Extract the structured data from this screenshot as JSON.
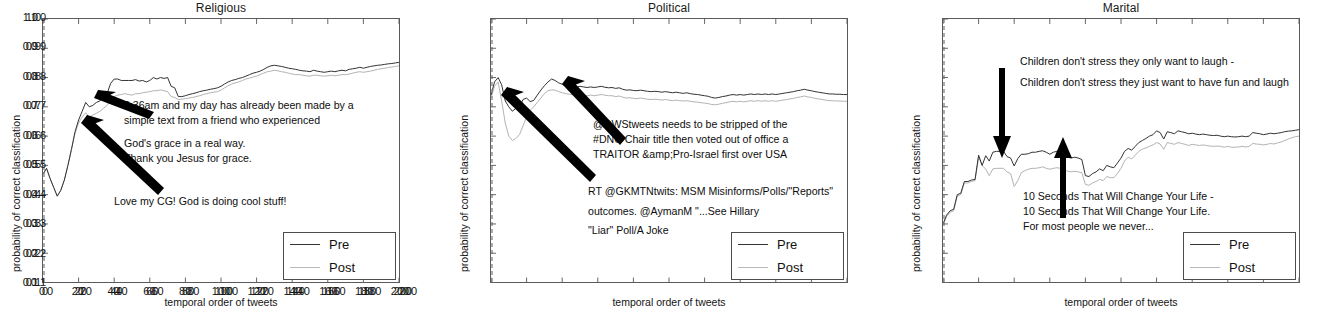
{
  "figure": {
    "width": 1336,
    "height": 311,
    "background": "#ffffff",
    "pre_color": "#333333",
    "post_color": "#b3b3b3",
    "axis_color": "#5a5a5a",
    "text_color": "#101010"
  },
  "axes": {
    "xlabel": "temporal order of tweets",
    "ylabel": "probability of correct classification",
    "xticks": [
      "0",
      "20",
      "40",
      "60",
      "80",
      "100",
      "120",
      "140",
      "160",
      "180",
      "200"
    ],
    "yticks": [
      "1.0",
      "0.9",
      "0.8",
      "0.7",
      "0.6",
      "0.5",
      "0.4",
      "0.3",
      "0.2",
      "0.1"
    ],
    "xlim": [
      0,
      200
    ],
    "ylim": [
      0.1,
      1.0
    ]
  },
  "legend": {
    "pre_label": "Pre",
    "post_label": "Post"
  },
  "panels": [
    {
      "id": "religious",
      "title": "Religious",
      "annotations": [
        {
          "id": "religious-annot-top",
          "lines": [
            "8:36am and my day has already been made by a",
            "simple text from a friend who experienced",
            "",
            " God's grace in a real way.",
            "Thank you Jesus for grace."
          ]
        },
        {
          "id": "religious-annot-bottom",
          "lines": [
            "Love my CG! God is doing cool stuff!"
          ]
        }
      ]
    },
    {
      "id": "political",
      "title": "Political",
      "annotations": [
        {
          "id": "political-annot-top",
          "lines": [
            "@DWStweets needs to be stripped of the",
            "#DNC Chair title then voted out of office a",
            "TRAITOR &amp;Pro-Israel first over USA"
          ]
        },
        {
          "id": "political-annot-bottom",
          "lines": [
            "RT @GKMTNtwits: MSM Misinforms/Polls/\"Reports\"",
            "",
            "outcomes. @AymanM \"...See Hillary",
            "",
            "\"Liar\" Poll/A Joke"
          ]
        }
      ]
    },
    {
      "id": "marital",
      "title": "Marital",
      "annotations": [
        {
          "id": "marital-annot-top",
          "lines": [
            "Children don't stress they only want to laugh -",
            "",
            "Children don't stress they just want to have fun and laugh"
          ]
        },
        {
          "id": "marital-annot-bottom",
          "lines": [
            "10 Seconds That Will Change Your Life -",
            "10 Seconds That Will Change Your Life.",
            " For most people we never..."
          ]
        }
      ]
    }
  ],
  "chart_data": [
    {
      "type": "line",
      "title": "Religious",
      "xlabel": "temporal order of tweets",
      "ylabel": "probability of correct classification",
      "xlim": [
        0,
        200
      ],
      "ylim": [
        0.1,
        1.0
      ],
      "grid": false,
      "legend_position": "lower-right",
      "x": [
        0,
        2,
        4,
        6,
        8,
        10,
        12,
        14,
        16,
        18,
        20,
        22,
        24,
        26,
        28,
        30,
        32,
        34,
        36,
        38,
        40,
        42,
        44,
        46,
        48,
        50,
        52,
        54,
        56,
        58,
        60,
        62,
        64,
        66,
        68,
        70,
        72,
        74,
        76,
        78,
        80,
        82,
        84,
        86,
        88,
        90,
        92,
        94,
        96,
        98,
        100,
        102,
        104,
        106,
        108,
        110,
        112,
        114,
        116,
        118,
        120,
        122,
        124,
        126,
        128,
        130,
        132,
        134,
        136,
        138,
        140,
        142,
        144,
        146,
        148,
        150,
        152,
        154,
        156,
        158,
        160,
        162,
        164,
        166,
        168,
        170,
        172,
        174,
        176,
        178,
        180,
        182,
        184,
        186,
        188,
        190,
        192,
        194,
        196,
        198,
        200
      ],
      "series": [
        {
          "name": "Pre",
          "values": [
            0.47,
            0.49,
            0.455,
            0.425,
            0.395,
            0.415,
            0.45,
            0.5,
            0.555,
            0.615,
            0.655,
            0.685,
            0.715,
            0.7,
            0.705,
            0.715,
            0.72,
            0.735,
            0.745,
            0.78,
            0.795,
            0.795,
            0.79,
            0.79,
            0.79,
            0.79,
            0.793,
            0.788,
            0.79,
            0.785,
            0.79,
            0.8,
            0.795,
            0.8,
            0.797,
            0.8,
            0.77,
            0.765,
            0.735,
            0.735,
            0.738,
            0.742,
            0.745,
            0.748,
            0.752,
            0.755,
            0.757,
            0.76,
            0.762,
            0.765,
            0.77,
            0.778,
            0.785,
            0.79,
            0.793,
            0.797,
            0.8,
            0.805,
            0.81,
            0.815,
            0.818,
            0.822,
            0.828,
            0.835,
            0.84,
            0.842,
            0.84,
            0.838,
            0.835,
            0.832,
            0.83,
            0.828,
            0.825,
            0.823,
            0.822,
            0.82,
            0.825,
            0.822,
            0.82,
            0.818,
            0.82,
            0.822,
            0.82,
            0.823,
            0.825,
            0.823,
            0.828,
            0.83,
            0.832,
            0.835,
            0.832,
            0.835,
            0.838,
            0.84,
            0.842,
            0.843,
            0.845,
            0.847,
            0.848,
            0.85,
            0.852
          ]
        },
        {
          "name": "Post",
          "values": [
            0.47,
            0.49,
            0.455,
            0.425,
            0.395,
            0.415,
            0.45,
            0.5,
            0.555,
            0.61,
            0.645,
            0.665,
            0.68,
            0.665,
            0.672,
            0.678,
            0.685,
            0.695,
            0.705,
            0.725,
            0.735,
            0.74,
            0.742,
            0.745,
            0.742,
            0.74,
            0.745,
            0.745,
            0.748,
            0.75,
            0.752,
            0.755,
            0.755,
            0.758,
            0.755,
            0.752,
            0.735,
            0.732,
            0.725,
            0.726,
            0.728,
            0.73,
            0.732,
            0.735,
            0.738,
            0.742,
            0.745,
            0.748,
            0.75,
            0.752,
            0.757,
            0.765,
            0.772,
            0.778,
            0.782,
            0.785,
            0.79,
            0.795,
            0.798,
            0.802,
            0.805,
            0.81,
            0.815,
            0.82,
            0.822,
            0.825,
            0.823,
            0.82,
            0.818,
            0.815,
            0.812,
            0.81,
            0.81,
            0.808,
            0.806,
            0.805,
            0.808,
            0.808,
            0.806,
            0.805,
            0.806,
            0.808,
            0.806,
            0.808,
            0.81,
            0.81,
            0.812,
            0.815,
            0.818,
            0.82,
            0.818,
            0.82,
            0.822,
            0.825,
            0.828,
            0.83,
            0.832,
            0.834,
            0.836,
            0.838,
            0.84
          ]
        }
      ]
    },
    {
      "type": "line",
      "title": "Political",
      "xlabel": "temporal order of tweets",
      "ylabel": "probability of correct classification",
      "xlim": [
        0,
        200
      ],
      "ylim": [
        0.1,
        1.0
      ],
      "grid": false,
      "legend_position": "lower-right",
      "x": [
        0,
        2,
        4,
        6,
        8,
        10,
        12,
        14,
        16,
        18,
        20,
        22,
        24,
        26,
        28,
        30,
        32,
        34,
        36,
        38,
        40,
        42,
        44,
        46,
        48,
        50,
        52,
        54,
        56,
        58,
        60,
        62,
        64,
        66,
        68,
        70,
        72,
        74,
        76,
        78,
        80,
        82,
        84,
        86,
        88,
        90,
        92,
        94,
        96,
        98,
        100,
        102,
        104,
        106,
        108,
        110,
        112,
        114,
        116,
        118,
        120,
        122,
        124,
        126,
        128,
        130,
        132,
        134,
        136,
        138,
        140,
        142,
        144,
        146,
        148,
        150,
        152,
        154,
        156,
        158,
        160,
        162,
        164,
        166,
        168,
        170,
        172,
        174,
        176,
        178,
        180,
        182,
        184,
        186,
        188,
        190,
        192,
        194,
        196,
        198,
        200
      ],
      "series": [
        {
          "name": "Pre",
          "values": [
            0.74,
            0.785,
            0.8,
            0.775,
            0.72,
            0.7,
            0.685,
            0.695,
            0.7,
            0.725,
            0.73,
            0.718,
            0.722,
            0.74,
            0.757,
            0.772,
            0.785,
            0.795,
            0.79,
            0.782,
            0.777,
            0.773,
            0.772,
            0.77,
            0.768,
            0.77,
            0.768,
            0.766,
            0.768,
            0.766,
            0.768,
            0.77,
            0.767,
            0.765,
            0.766,
            0.763,
            0.765,
            0.76,
            0.757,
            0.758,
            0.756,
            0.755,
            0.757,
            0.755,
            0.753,
            0.752,
            0.753,
            0.752,
            0.75,
            0.752,
            0.75,
            0.748,
            0.75,
            0.748,
            0.746,
            0.748,
            0.745,
            0.743,
            0.742,
            0.74,
            0.738,
            0.736,
            0.732,
            0.73,
            0.732,
            0.735,
            0.737,
            0.74,
            0.742,
            0.74,
            0.742,
            0.74,
            0.742,
            0.744,
            0.742,
            0.744,
            0.742,
            0.744,
            0.742,
            0.744,
            0.742,
            0.744,
            0.746,
            0.748,
            0.75,
            0.752,
            0.755,
            0.757,
            0.76,
            0.757,
            0.755,
            0.752,
            0.75,
            0.748,
            0.746,
            0.744,
            0.744,
            0.743,
            0.743,
            0.742,
            0.742
          ]
        },
        {
          "name": "Post",
          "values": [
            0.73,
            0.77,
            0.785,
            0.72,
            0.645,
            0.6,
            0.585,
            0.592,
            0.605,
            0.635,
            0.665,
            0.688,
            0.7,
            0.715,
            0.73,
            0.745,
            0.755,
            0.758,
            0.757,
            0.752,
            0.748,
            0.745,
            0.743,
            0.742,
            0.74,
            0.742,
            0.74,
            0.738,
            0.74,
            0.738,
            0.74,
            0.742,
            0.74,
            0.738,
            0.738,
            0.735,
            0.737,
            0.733,
            0.73,
            0.731,
            0.729,
            0.728,
            0.73,
            0.728,
            0.726,
            0.725,
            0.726,
            0.725,
            0.723,
            0.725,
            0.723,
            0.721,
            0.723,
            0.721,
            0.72,
            0.721,
            0.719,
            0.717,
            0.716,
            0.714,
            0.713,
            0.711,
            0.708,
            0.707,
            0.709,
            0.712,
            0.714,
            0.717,
            0.719,
            0.717,
            0.719,
            0.717,
            0.719,
            0.721,
            0.719,
            0.721,
            0.719,
            0.721,
            0.719,
            0.721,
            0.719,
            0.721,
            0.723,
            0.725,
            0.727,
            0.729,
            0.732,
            0.734,
            0.737,
            0.734,
            0.732,
            0.729,
            0.727,
            0.725,
            0.723,
            0.721,
            0.721,
            0.72,
            0.72,
            0.719,
            0.719
          ]
        }
      ]
    },
    {
      "type": "line",
      "title": "Marital",
      "xlabel": "temporal order of tweets",
      "ylabel": "probability of correct classification",
      "xlim": [
        0,
        200
      ],
      "ylim": [
        0.1,
        1.0
      ],
      "grid": false,
      "legend_position": "lower-right",
      "x": [
        0,
        2,
        4,
        6,
        8,
        10,
        12,
        14,
        16,
        18,
        20,
        22,
        24,
        26,
        28,
        30,
        32,
        34,
        36,
        38,
        40,
        42,
        44,
        46,
        48,
        50,
        52,
        54,
        56,
        58,
        60,
        62,
        64,
        66,
        68,
        70,
        72,
        74,
        76,
        78,
        80,
        82,
        84,
        86,
        88,
        90,
        92,
        94,
        96,
        98,
        100,
        102,
        104,
        106,
        108,
        110,
        112,
        114,
        116,
        118,
        120,
        122,
        124,
        126,
        128,
        130,
        132,
        134,
        136,
        138,
        140,
        142,
        144,
        146,
        148,
        150,
        152,
        154,
        156,
        158,
        160,
        162,
        164,
        166,
        168,
        170,
        172,
        174,
        176,
        178,
        180,
        182,
        184,
        186,
        188,
        190,
        192,
        194,
        196,
        198,
        200
      ],
      "series": [
        {
          "name": "Pre",
          "values": [
            0.3,
            0.33,
            0.345,
            0.35,
            0.4,
            0.405,
            0.445,
            0.445,
            0.45,
            0.452,
            0.535,
            0.5,
            0.533,
            0.515,
            0.545,
            0.548,
            0.548,
            0.548,
            0.53,
            0.525,
            0.498,
            0.523,
            0.538,
            0.538,
            0.54,
            0.545,
            0.545,
            0.548,
            0.55,
            0.545,
            0.538,
            0.545,
            0.548,
            0.542,
            0.535,
            0.528,
            0.525,
            0.528,
            0.525,
            0.52,
            0.465,
            0.462,
            0.472,
            0.478,
            0.488,
            0.482,
            0.5,
            0.495,
            0.492,
            0.508,
            0.525,
            0.548,
            0.558,
            0.552,
            0.565,
            0.578,
            0.585,
            0.592,
            0.6,
            0.605,
            0.618,
            0.612,
            0.59,
            0.615,
            0.612,
            0.608,
            0.618,
            0.615,
            0.612,
            0.608,
            0.61,
            0.607,
            0.605,
            0.607,
            0.605,
            0.603,
            0.602,
            0.603,
            0.6,
            0.598,
            0.6,
            0.598,
            0.597,
            0.598,
            0.6,
            0.598,
            0.6,
            0.612,
            0.61,
            0.608,
            0.605,
            0.607,
            0.61,
            0.608,
            0.61,
            0.612,
            0.615,
            0.617,
            0.618,
            0.62,
            0.622
          ]
        },
        {
          "name": "Post",
          "values": [
            0.295,
            0.325,
            0.34,
            0.345,
            0.395,
            0.4,
            0.44,
            0.44,
            0.445,
            0.448,
            0.528,
            0.5,
            0.487,
            0.465,
            0.488,
            0.49,
            0.49,
            0.49,
            0.478,
            0.472,
            0.428,
            0.448,
            0.475,
            0.482,
            0.487,
            0.49,
            0.49,
            0.492,
            0.495,
            0.49,
            0.487,
            0.49,
            0.492,
            0.49,
            0.485,
            0.48,
            0.478,
            0.48,
            0.478,
            0.475,
            0.435,
            0.432,
            0.44,
            0.445,
            0.452,
            0.448,
            0.462,
            0.458,
            0.458,
            0.472,
            0.49,
            0.515,
            0.528,
            0.522,
            0.535,
            0.548,
            0.555,
            0.56,
            0.565,
            0.57,
            0.578,
            0.573,
            0.555,
            0.578,
            0.575,
            0.572,
            0.578,
            0.575,
            0.572,
            0.568,
            0.572,
            0.57,
            0.568,
            0.57,
            0.568,
            0.566,
            0.565,
            0.566,
            0.565,
            0.562,
            0.565,
            0.562,
            0.562,
            0.563,
            0.565,
            0.563,
            0.565,
            0.575,
            0.573,
            0.572,
            0.57,
            0.572,
            0.575,
            0.573,
            0.577,
            0.58,
            0.585,
            0.59,
            0.595,
            0.598,
            0.6
          ]
        }
      ]
    }
  ]
}
